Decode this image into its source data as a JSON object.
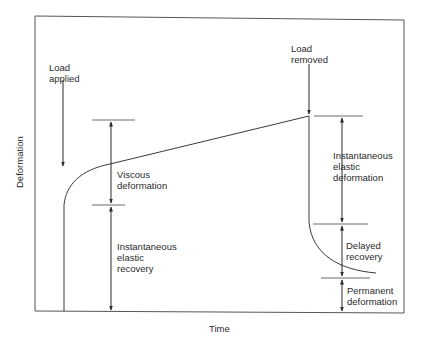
{
  "diagram": {
    "type": "deformation-time curve (creep and recovery)",
    "axes": {
      "x_label": "Time",
      "y_label": "Deformation"
    },
    "annotations": {
      "load_applied": "Load\napplied",
      "load_removed": "Load\nremoved",
      "viscous_deformation": "Viscous\ndeformation",
      "instantaneous_elastic_recovery": "Instantaneous\nelastic\nrecovery",
      "instantaneous_elastic_deformation": "Instantaneous\nelastic\ndeformation",
      "delayed_recovery": "Delayed\nrecovery",
      "permanent_deformation": "Permanent\ndeformation"
    },
    "colors": {
      "line": "#3a3a3a",
      "frame": "#555555",
      "background": "#ffffff"
    }
  }
}
